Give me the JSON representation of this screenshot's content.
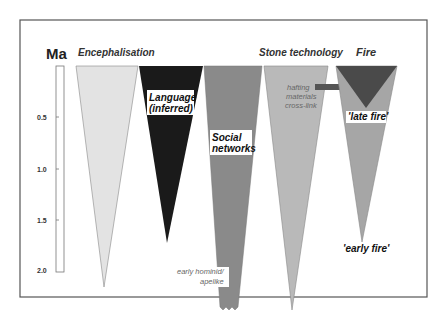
{
  "diagram": {
    "axis": {
      "unit": "Ma",
      "ticks": [
        "0.5",
        "1.0",
        "1.5",
        "2.0"
      ]
    },
    "headers": {
      "encephalisation": "Encephalisation",
      "stone_technology": "Stone technology",
      "fire": "Fire"
    },
    "labels": {
      "language_line1": "Language",
      "language_line2": "(inferred)",
      "social_line1": "Social",
      "social_line2": "networks",
      "late_fire": "'late fire'",
      "early_fire": "'early fire'",
      "early_hominid_line1": "early hominid/",
      "early_hominid_line2": "apelike",
      "hafting_line1": "hafting",
      "hafting_line2": "materials",
      "hafting_line3": "cross-link"
    },
    "colors": {
      "encephalisation": "#e3e3e3",
      "language": "#1a1a1a",
      "social_networks": "#8a8a8a",
      "stone_technology": "#b9b9b9",
      "fire_outer": "#a6a6a6",
      "fire_inner": "#4a4a4a",
      "hafting_bar": "#555555",
      "frame": "#555555"
    }
  }
}
